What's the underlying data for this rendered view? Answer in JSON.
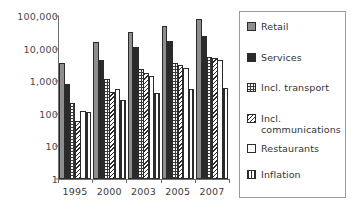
{
  "chart_data": {
    "type": "bar",
    "title": "",
    "xlabel": "",
    "ylabel": "",
    "yscale": "log",
    "ylim": [
      1,
      100000
    ],
    "grid": false,
    "legend_position": "right",
    "categories": [
      "1995",
      "2000",
      "2003",
      "2005",
      "2007"
    ],
    "ytick_labels": [
      "100,000",
      "10,000",
      "1,000",
      "100",
      "10",
      "1"
    ],
    "ytick_values": [
      100000,
      10000,
      1000,
      100,
      10,
      1
    ],
    "series": [
      {
        "name": "Retail",
        "values": [
          3500,
          16000,
          33000,
          50000,
          80000
        ]
      },
      {
        "name": "Services",
        "values": [
          800,
          4400,
          11000,
          17000,
          24000
        ]
      },
      {
        "name": "Incl. transport",
        "values": [
          220,
          1150,
          2300,
          3500,
          5500
        ]
      },
      {
        "name": "Incl. communications",
        "values": [
          60,
          480,
          1800,
          3100,
          5200
        ]
      },
      {
        "name": "Restaurants",
        "values": [
          125,
          560,
          1400,
          2500,
          4600
        ]
      },
      {
        "name": "Inflation",
        "values": [
          110,
          270,
          430,
          560,
          620
        ]
      }
    ]
  },
  "legend": {
    "items": [
      {
        "label": "Retail",
        "swatch": "solid-gray",
        "color": "#8e8e8e"
      },
      {
        "label": "Services",
        "swatch": "solid-black",
        "color": "#2a2a2a"
      },
      {
        "label": "Incl. transport",
        "swatch": "dark-dotted",
        "color": "#3a3a3a"
      },
      {
        "label": "Incl. communications",
        "swatch": "diagonal-hatch",
        "color": "#ffffff"
      },
      {
        "label": "Restaurants",
        "swatch": "white-empty",
        "color": "#ffffff"
      },
      {
        "label": "Inflation",
        "swatch": "horizontal-lines",
        "color": "#ffffff"
      }
    ]
  },
  "axes": {
    "axis_color": "#6e6e6e",
    "text_color": "#3c3c3c"
  }
}
